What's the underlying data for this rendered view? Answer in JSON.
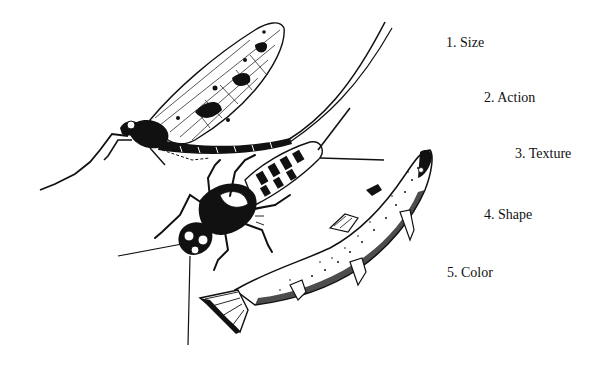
{
  "figure": {
    "illustration": {
      "subjects": [
        "mayfly-adult",
        "mayfly-nymph",
        "trout"
      ],
      "style": "black-ink line drawing"
    },
    "labels": [
      {
        "text": "1. Size",
        "x": 446,
        "y": 36
      },
      {
        "text": "2. Action",
        "x": 484,
        "y": 91
      },
      {
        "text": "3. Texture",
        "x": 515,
        "y": 147
      },
      {
        "text": "4. Shape",
        "x": 484,
        "y": 208
      },
      {
        "text": "5. Color",
        "x": 447,
        "y": 266
      }
    ],
    "colors": {
      "ink": "#111111",
      "background": "#ffffff"
    }
  }
}
